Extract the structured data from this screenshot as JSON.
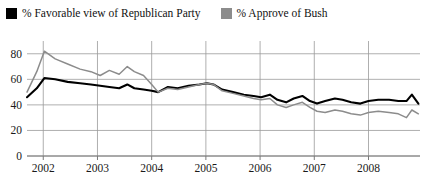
{
  "legend": {
    "position": "top-left",
    "items": [
      {
        "label": "% Favorable view of Republican Party",
        "color": "#000000",
        "marker": "square"
      },
      {
        "label": "% Approve of Bush",
        "color": "#8c8c8c",
        "marker": "square"
      }
    ]
  },
  "axes": {
    "y_ticks": [
      "0",
      "20",
      "40",
      "60",
      "80"
    ],
    "x_ticks": [
      "2002",
      "2003",
      "2004",
      "2005",
      "2006",
      "2007",
      "2008"
    ]
  },
  "colors": {
    "republican_line": "#000000",
    "bush_line": "#8c8c8c",
    "gridline": "#9a9a9a",
    "axis": "#7a7a7a",
    "background": "#ffffff"
  },
  "chart_data": {
    "type": "line",
    "title": "",
    "xlabel": "",
    "ylabel": "",
    "xlim": [
      2001.7,
      2008.95
    ],
    "ylim": [
      0,
      90
    ],
    "yticks": [
      0,
      20,
      40,
      60,
      80
    ],
    "xticks": [
      2002,
      2003,
      2004,
      2005,
      2006,
      2007,
      2008
    ],
    "grid": true,
    "legend_position": "above-plot-left",
    "series": [
      {
        "name": "% Favorable view of Republican Party",
        "color": "#000000",
        "points": [
          [
            2001.7,
            46
          ],
          [
            2001.88,
            53
          ],
          [
            2002.02,
            61
          ],
          [
            2002.22,
            60
          ],
          [
            2002.45,
            58
          ],
          [
            2002.68,
            57
          ],
          [
            2002.88,
            56
          ],
          [
            2003.05,
            55
          ],
          [
            2003.22,
            54
          ],
          [
            2003.4,
            53
          ],
          [
            2003.55,
            56
          ],
          [
            2003.68,
            53
          ],
          [
            2003.85,
            52
          ],
          [
            2004.0,
            51
          ],
          [
            2004.12,
            50
          ],
          [
            2004.3,
            54
          ],
          [
            2004.48,
            53
          ],
          [
            2004.68,
            55
          ],
          [
            2004.88,
            56
          ],
          [
            2005.02,
            57
          ],
          [
            2005.14,
            56
          ],
          [
            2005.3,
            52
          ],
          [
            2005.5,
            50
          ],
          [
            2005.7,
            48
          ],
          [
            2005.88,
            47
          ],
          [
            2006.02,
            46
          ],
          [
            2006.18,
            48
          ],
          [
            2006.32,
            44
          ],
          [
            2006.48,
            42
          ],
          [
            2006.62,
            45
          ],
          [
            2006.78,
            47
          ],
          [
            2006.92,
            43
          ],
          [
            2007.05,
            41
          ],
          [
            2007.2,
            43
          ],
          [
            2007.38,
            45
          ],
          [
            2007.52,
            44
          ],
          [
            2007.68,
            42
          ],
          [
            2007.85,
            41
          ],
          [
            2008.0,
            43
          ],
          [
            2008.18,
            44
          ],
          [
            2008.38,
            44
          ],
          [
            2008.55,
            43
          ],
          [
            2008.7,
            43
          ],
          [
            2008.8,
            48
          ],
          [
            2008.92,
            41
          ]
        ]
      },
      {
        "name": "% Approve of Bush",
        "color": "#8c8c8c",
        "points": [
          [
            2001.7,
            50
          ],
          [
            2001.88,
            66
          ],
          [
            2002.02,
            82
          ],
          [
            2002.22,
            76
          ],
          [
            2002.45,
            72
          ],
          [
            2002.68,
            68
          ],
          [
            2002.88,
            66
          ],
          [
            2003.05,
            63
          ],
          [
            2003.22,
            67
          ],
          [
            2003.4,
            64
          ],
          [
            2003.55,
            70
          ],
          [
            2003.68,
            66
          ],
          [
            2003.85,
            63
          ],
          [
            2004.0,
            56
          ],
          [
            2004.12,
            50
          ],
          [
            2004.3,
            53
          ],
          [
            2004.48,
            52
          ],
          [
            2004.68,
            54
          ],
          [
            2004.88,
            56
          ],
          [
            2005.02,
            57
          ],
          [
            2005.14,
            56
          ],
          [
            2005.3,
            51
          ],
          [
            2005.5,
            49
          ],
          [
            2005.7,
            47
          ],
          [
            2005.88,
            45
          ],
          [
            2006.02,
            44
          ],
          [
            2006.18,
            45
          ],
          [
            2006.32,
            40
          ],
          [
            2006.48,
            38
          ],
          [
            2006.62,
            40
          ],
          [
            2006.78,
            42
          ],
          [
            2006.92,
            38
          ],
          [
            2007.05,
            35
          ],
          [
            2007.2,
            34
          ],
          [
            2007.38,
            36
          ],
          [
            2007.52,
            35
          ],
          [
            2007.68,
            33
          ],
          [
            2007.85,
            32
          ],
          [
            2008.0,
            34
          ],
          [
            2008.18,
            35
          ],
          [
            2008.38,
            34
          ],
          [
            2008.55,
            33
          ],
          [
            2008.7,
            30
          ],
          [
            2008.8,
            36
          ],
          [
            2008.92,
            33
          ]
        ]
      }
    ]
  }
}
